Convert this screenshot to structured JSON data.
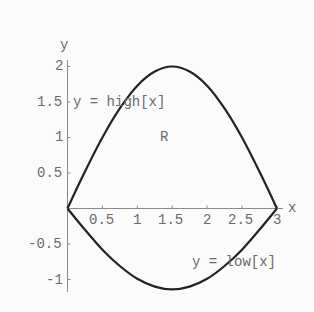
{
  "chart_data": {
    "type": "line",
    "title": "",
    "xlabel": "x",
    "ylabel": "y",
    "xlim": [
      0,
      3
    ],
    "ylim": [
      -1.2,
      2.1
    ],
    "grid": false,
    "x_ticks": [
      "0.5",
      "1",
      "1.5",
      "2",
      "2.5",
      "3"
    ],
    "y_ticks": [
      "2",
      "1.5",
      "1",
      "0.5",
      "-0.5",
      "-1"
    ],
    "series": [
      {
        "name": "y = high[x]",
        "x": [
          0,
          0.25,
          0.5,
          0.75,
          1,
          1.25,
          1.5,
          1.75,
          2,
          2.25,
          2.5,
          2.75,
          3
        ],
        "values": [
          0,
          0.52,
          1.0,
          1.41,
          1.73,
          1.93,
          2.0,
          1.93,
          1.73,
          1.41,
          1.0,
          0.52,
          0
        ]
      },
      {
        "name": "y = low[x]",
        "x": [
          0,
          0.25,
          0.5,
          0.75,
          1,
          1.25,
          1.5,
          1.75,
          2,
          2.25,
          2.5,
          2.75,
          3
        ],
        "values": [
          0,
          -0.3,
          -0.58,
          -0.81,
          -0.99,
          -1.1,
          -1.14,
          -1.1,
          -0.99,
          -0.81,
          -0.58,
          -0.3,
          0
        ]
      }
    ],
    "annotations": [
      {
        "text": "y = high[x]",
        "x": 0.1,
        "y": 1.5
      },
      {
        "text": "R",
        "x": 1.45,
        "y": 1.0
      },
      {
        "text": "y = low[x]",
        "x": 1.85,
        "y": -0.75
      }
    ]
  },
  "labels": {
    "y_axis": "y",
    "x_axis": "x",
    "high": "y = high[x]",
    "low": "y = low[x]",
    "region": "R"
  },
  "ticks": {
    "x": [
      "0.5",
      "1",
      "1.5",
      "2",
      "2.5",
      "3"
    ],
    "y": [
      "2",
      "1.5",
      "1",
      "0.5",
      "-0.5",
      "-1"
    ]
  }
}
